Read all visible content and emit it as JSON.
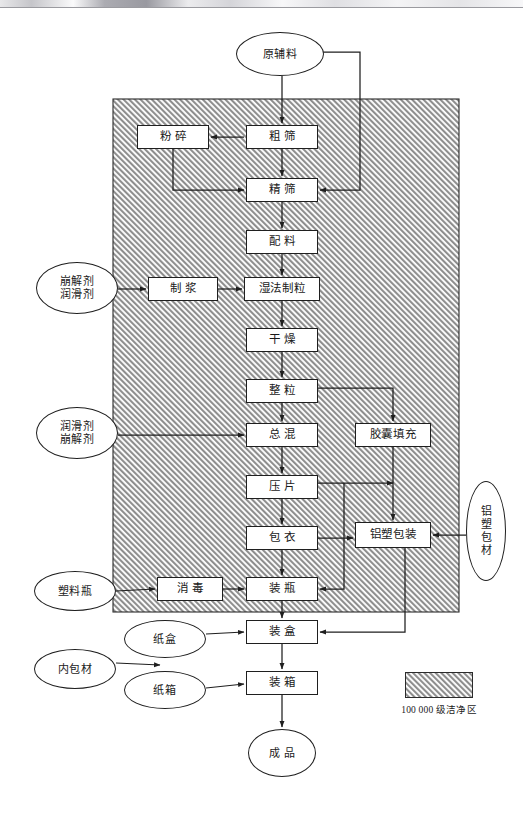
{
  "figure": {
    "clean_zone_fill": "#c9c9c9",
    "line_color": "#1f1f1f",
    "node_fill": "#ffffff"
  },
  "legend": {
    "label": "100 000 级洁净区",
    "swatch_name": "hatched-gray-swatch"
  },
  "clean_zone": {
    "name": "100000-clean-area",
    "x": 113,
    "y": 99,
    "width": 346,
    "height": 513
  },
  "nodes": {
    "raw_material": {
      "label": "原辅料",
      "shape": "ellipse",
      "x": 236,
      "y": 32,
      "w": 88,
      "h": 44
    },
    "coarse_sieving": {
      "label": "粗  筛",
      "shape": "box",
      "x": 246,
      "y": 125,
      "w": 72,
      "h": 24
    },
    "crushing": {
      "label": "粉  碎",
      "shape": "box",
      "x": 137,
      "y": 125,
      "w": 72,
      "h": 24
    },
    "fine_sieving": {
      "label": "精  筛",
      "shape": "box",
      "x": 246,
      "y": 178,
      "w": 72,
      "h": 24
    },
    "batching": {
      "label": "配  料",
      "shape": "box",
      "x": 246,
      "y": 230,
      "w": 72,
      "h": 24
    },
    "disint_lubri_1": {
      "label": "崩解剂\n润滑剂",
      "shape": "ellipse",
      "x": 36,
      "y": 262,
      "w": 82,
      "h": 52
    },
    "pulping": {
      "label": "制  浆",
      "shape": "box",
      "x": 148,
      "y": 277,
      "w": 70,
      "h": 24
    },
    "wet_granulation": {
      "label": "湿法制粒",
      "shape": "box",
      "x": 244,
      "y": 277,
      "w": 76,
      "h": 24
    },
    "drying": {
      "label": "干  燥",
      "shape": "box",
      "x": 246,
      "y": 328,
      "w": 72,
      "h": 24
    },
    "sizing": {
      "label": "整  粒",
      "shape": "box",
      "x": 246,
      "y": 379,
      "w": 72,
      "h": 24
    },
    "lubri_disint_2": {
      "label": "润滑剂\n崩解剂",
      "shape": "ellipse",
      "x": 36,
      "y": 407,
      "w": 82,
      "h": 52
    },
    "total_mixing": {
      "label": "总  混",
      "shape": "box",
      "x": 246,
      "y": 423,
      "w": 72,
      "h": 24
    },
    "capsule_filling": {
      "label": "胶囊填充",
      "shape": "box",
      "x": 355,
      "y": 423,
      "w": 76,
      "h": 24
    },
    "tableting": {
      "label": "压  片",
      "shape": "box",
      "x": 246,
      "y": 475,
      "w": 72,
      "h": 24
    },
    "coating": {
      "label": "包  衣",
      "shape": "box",
      "x": 246,
      "y": 526,
      "w": 72,
      "h": 24
    },
    "alu_plastic_pack": {
      "label": "铝塑包装",
      "shape": "box",
      "x": 355,
      "y": 522,
      "w": 76,
      "h": 26
    },
    "alu_plastic_mat": {
      "label": "铝塑包材",
      "shape": "ellipse",
      "x": 466,
      "y": 481,
      "w": 40,
      "h": 100,
      "vertical": true
    },
    "plastic_bottle": {
      "label": "塑料瓶",
      "shape": "ellipse",
      "x": 34,
      "y": 571,
      "w": 82,
      "h": 40
    },
    "sterilizing": {
      "label": "消  毒",
      "shape": "box",
      "x": 157,
      "y": 577,
      "w": 66,
      "h": 24
    },
    "bottling": {
      "label": "装  瓶",
      "shape": "box",
      "x": 246,
      "y": 577,
      "w": 72,
      "h": 24
    },
    "paper_box": {
      "label": "纸盒",
      "shape": "ellipse",
      "x": 124,
      "y": 620,
      "w": 82,
      "h": 38
    },
    "inner_packing": {
      "label": "内包材",
      "shape": "ellipse",
      "x": 34,
      "y": 649,
      "w": 82,
      "h": 40
    },
    "paper_carton": {
      "label": "纸箱",
      "shape": "ellipse",
      "x": 124,
      "y": 671,
      "w": 82,
      "h": 38
    },
    "boxing": {
      "label": "装  盒",
      "shape": "box",
      "x": 246,
      "y": 620,
      "w": 72,
      "h": 24
    },
    "cartoning": {
      "label": "装  箱",
      "shape": "box",
      "x": 246,
      "y": 671,
      "w": 72,
      "h": 24
    },
    "finished_product": {
      "label": "成  品",
      "shape": "ellipse",
      "x": 248,
      "y": 729,
      "w": 68,
      "h": 48
    }
  },
  "legend_box": {
    "x": 405,
    "y": 672,
    "w": 68,
    "h": 26
  },
  "legend_text_pos": {
    "x": 393,
    "y": 702,
    "w": 92
  }
}
